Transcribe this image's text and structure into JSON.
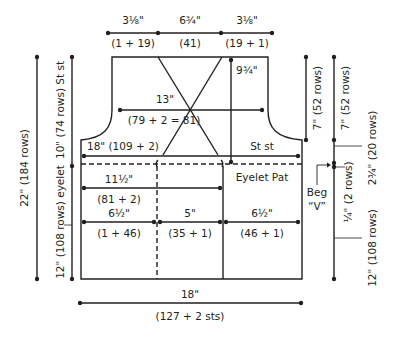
{
  "diagram": {
    "type": "knitting-schematic",
    "ink_color": "#231f20",
    "background": "#ffffff",
    "top_widths": [
      {
        "measure": "3⅛\"",
        "stitches": "(1 + 19)"
      },
      {
        "measure": "6¾\"",
        "stitches": "(41)"
      },
      {
        "measure": "3⅛\"",
        "stitches": "(19 + 1)"
      }
    ],
    "neck_depth": "9¾\"",
    "chest": {
      "measure": "13\"",
      "stitches": "(79 + 2 = 81)"
    },
    "upper_width": "18\" (109 + 2)",
    "upper_pattern": "St st",
    "lower_pattern": "Eyelet Pat",
    "eyelet_width": {
      "measure": "11½\"",
      "stitches": "(81 + 2)"
    },
    "lower_sections": [
      {
        "measure": "6½\"",
        "stitches": "(1 + 46)"
      },
      {
        "measure": "5\"",
        "stitches": "(35 + 1)"
      },
      {
        "measure": "6½\"",
        "stitches": "(46 + 1)"
      }
    ],
    "bottom_width": {
      "measure": "18\"",
      "stitches": "(127 + 2 sts)"
    },
    "left_heights": {
      "total": "22\" (184 rows)",
      "upper": "10\" (74 rows) St st",
      "lower": "12\" (108 rows) eyelet"
    },
    "right_heights": {
      "armhole_inner": "7\" (52 rows)",
      "armhole_outer": "7\" (52 rows)",
      "upper_band": "2¾\" (20 rows)",
      "v_band": "¼\" (2 rows)",
      "lower": "12\" (108 rows)"
    },
    "beg_v_label_line1": "Beg",
    "beg_v_label_line2": "“V”"
  }
}
